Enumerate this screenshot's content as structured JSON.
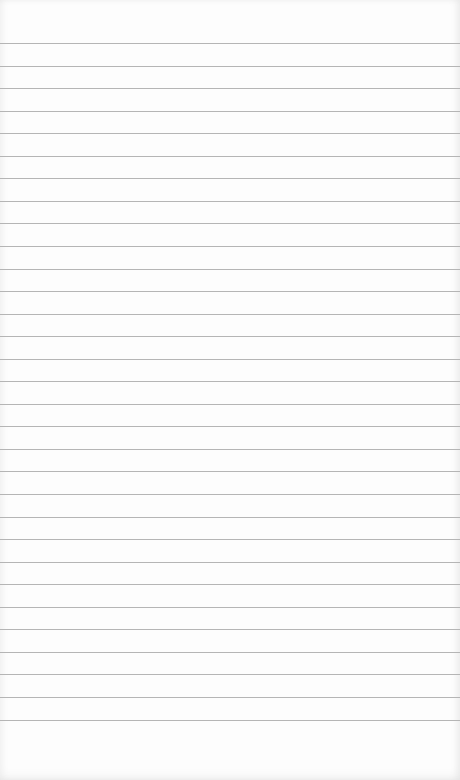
{
  "paper": {
    "type": "lined-notepad",
    "background_color": "#fdfdfd",
    "line_color": "#b5b5b5",
    "line_count": 31,
    "first_line_y": 43,
    "line_spacing": 22.55,
    "text_content": ""
  }
}
